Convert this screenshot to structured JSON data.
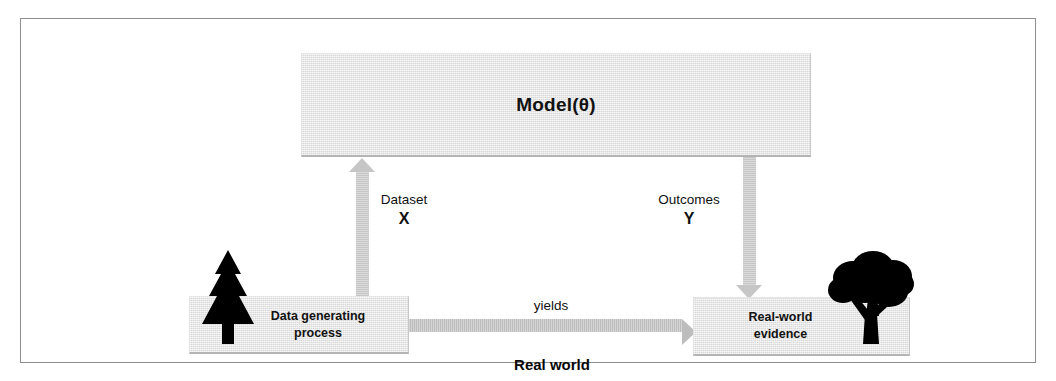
{
  "diagram": {
    "title_caption": "Real world",
    "model": {
      "label": "Model(θ)"
    },
    "nodes": [
      {
        "id": "data-generating-process",
        "line1": "Data generating",
        "line2": "process",
        "icon": "conifer-tree-icon"
      },
      {
        "id": "real-world-evidence",
        "line1": "Real-world",
        "line2": "evidence",
        "icon": "broadleaf-tree-icon"
      }
    ],
    "edges": {
      "dataset": {
        "label": "Dataset",
        "symbol": "X",
        "direction": "up"
      },
      "outcomes": {
        "label": "Outcomes",
        "symbol": "Y",
        "direction": "down"
      },
      "yields": {
        "label": "yields",
        "direction": "right"
      }
    },
    "colors": {
      "box_fill": "#d9d9d9",
      "arrow_fill": "#c6c6c6",
      "frame_border": "#8d8d8d",
      "text": "#101010",
      "icon": "#000000"
    }
  }
}
